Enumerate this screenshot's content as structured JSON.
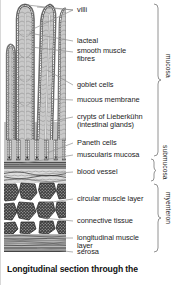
{
  "figure": {
    "caption": "Longitudinal section through the",
    "title_alt": "Longitudinal section through the"
  },
  "labels": [
    {
      "id": "villi",
      "text": "villi"
    },
    {
      "id": "lacteal",
      "text": "lacteal"
    },
    {
      "id": "smooth-muscle-fibres",
      "text": "smooth muscle"
    },
    {
      "id": "smooth-muscle-fibres2",
      "text": "fibres"
    },
    {
      "id": "goblet-cells",
      "text": "goblet cells"
    },
    {
      "id": "mucous-membrane",
      "text": "mucous membrane"
    },
    {
      "id": "crypts-lieberkuhn",
      "text": "crypts of Lieberkühn"
    },
    {
      "id": "intestinal-glands",
      "text": "(intestinal glands)"
    },
    {
      "id": "paneth-cells",
      "text": "Paneth cells"
    },
    {
      "id": "muscularis-mucosa",
      "text": "muscularis mucosa"
    },
    {
      "id": "blood-vessel",
      "text": "blood vessel"
    },
    {
      "id": "circular-muscle-layer",
      "text": "circular muscle layer"
    },
    {
      "id": "connective-tissue",
      "text": "connective tissue"
    },
    {
      "id": "longitudinal-muscle",
      "text": "longitudinal muscle"
    },
    {
      "id": "longitudinal-muscle2",
      "text": "layer"
    },
    {
      "id": "serosa",
      "text": "serosa"
    }
  ],
  "regions": [
    {
      "id": "mucosa",
      "text": "mucosa"
    },
    {
      "id": "submucosa",
      "text": "submucosa"
    },
    {
      "id": "myenteron",
      "text": "myenteron"
    }
  ],
  "colors": {
    "ink": "#1d1d1d",
    "leader": "#8a8a8a",
    "tissue_light": "#cfcfcf",
    "tissue_mid": "#9a9a9a",
    "tissue_dark": "#4a4a4a",
    "background": "#ffffff"
  }
}
